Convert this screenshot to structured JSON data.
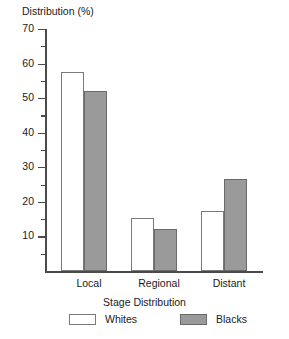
{
  "chart_data": {
    "type": "bar",
    "title": "",
    "ylabel": "Distribution (%)",
    "xlabel": "Stage Distribution",
    "categories": [
      "Local",
      "Regional",
      "Distant"
    ],
    "series": [
      {
        "name": "Whites",
        "values": [
          57.5,
          15.3,
          17.5
        ],
        "color": "#ffffff"
      },
      {
        "name": "Blacks",
        "values": [
          52.0,
          12.3,
          26.5
        ],
        "color": "#9a9a9a"
      }
    ],
    "ylim": [
      0,
      70
    ],
    "yticks": [
      0,
      10,
      20,
      30,
      40,
      50,
      60,
      70
    ],
    "ytick_labels": [
      "",
      "10",
      "20",
      "30",
      "40",
      "50",
      "60",
      "70"
    ],
    "minor_tick_interval": 5,
    "grid": false,
    "legend_position": "bottom"
  },
  "axis": {
    "y_labels": {
      "t70": "70",
      "t60": "60",
      "t50": "50",
      "t40": "40",
      "t30": "30",
      "t20": "20",
      "t10": "10"
    }
  }
}
